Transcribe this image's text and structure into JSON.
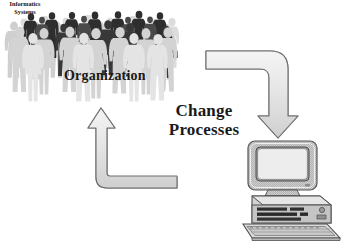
{
  "diagram": {
    "background_color": "#ffffff",
    "width": 355,
    "height": 248
  },
  "labels": {
    "organization": "Organization",
    "change_line1": "Change",
    "change_line2": "Processes"
  },
  "computer": {
    "screen_line1": "Informatics",
    "screen_line2": "Systems",
    "icon_name": "desktop-computer-icon"
  },
  "crowd": {
    "icon_name": "crowd-of-people-icon",
    "figure_count": 31,
    "tones": [
      "#d9d9d9",
      "#c6c6c6",
      "#b0b0b0",
      "#8c8c8c",
      "#5a5a5a",
      "#2b2b2b"
    ]
  },
  "arrows": [
    {
      "name": "arrow-organization-to-systems",
      "direction": "down",
      "path": "elbow: horizontal right from organization, then down into computer",
      "fill_color": "#e2e2e2",
      "stroke_color": "#6e6e6e"
    },
    {
      "name": "arrow-systems-to-organization",
      "direction": "up",
      "path": "elbow: horizontal left from computer, then up into organization",
      "fill_color": "#e2e2e2",
      "stroke_color": "#6e6e6e"
    }
  ],
  "colors": {
    "text": "#1a1a1a",
    "arrow_fill": "#e2e2e2",
    "arrow_stroke": "#6e6e6e",
    "monitor_body": "#c9c9c9",
    "screen_fill": "#e8e8e8"
  }
}
